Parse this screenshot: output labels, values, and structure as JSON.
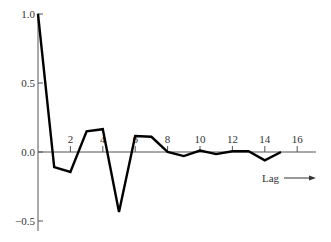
{
  "chart_data": {
    "type": "line",
    "title": "",
    "xlabel": "Lag",
    "ylabel": "",
    "x": [
      0,
      1,
      2,
      3,
      4,
      5,
      6,
      7,
      8,
      9,
      10,
      11,
      12,
      13,
      14,
      15
    ],
    "values": [
      1.0,
      -0.11,
      -0.145,
      0.15,
      0.165,
      -0.435,
      0.115,
      0.11,
      0.0,
      -0.03,
      0.01,
      -0.015,
      0.005,
      0.005,
      -0.06,
      0.0
    ],
    "xticks": [
      2,
      4,
      6,
      8,
      10,
      12,
      14,
      16
    ],
    "yticks": [
      1.0,
      0.5,
      0.0,
      -0.5
    ],
    "ytick_labels": [
      "1.0",
      "0.5",
      "0.0",
      "−0.5"
    ],
    "xlim": [
      0,
      17.2
    ],
    "ylim": [
      -0.57,
      1.0
    ],
    "grid": false,
    "legend": null
  },
  "colors": {
    "line": "#000000",
    "axis": "#555555",
    "text": "#333333"
  }
}
